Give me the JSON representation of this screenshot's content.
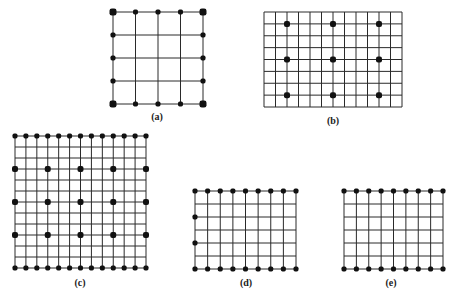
{
  "figure": {
    "background": "#ffffff",
    "line_color": "#2a2a2a",
    "dot_color": "#111111",
    "panels": [
      {
        "id": "a",
        "label": "(a)",
        "x": 113,
        "y": 12,
        "width": 90,
        "height": 92,
        "cols": 4,
        "rows": 4,
        "label_x": 157,
        "label_y": 111,
        "dots": "boundary-all",
        "corner_dot_size": 7,
        "dot_size": 5
      },
      {
        "id": "b",
        "label": "(b)",
        "x": 264,
        "y": 12,
        "width": 138,
        "height": 95,
        "cols": 12,
        "rows": 8,
        "label_x": 333,
        "label_y": 115,
        "dots": "interior-points",
        "points": [
          [
            2,
            1
          ],
          [
            6,
            1
          ],
          [
            10,
            1
          ],
          [
            2,
            4
          ],
          [
            6,
            4
          ],
          [
            10,
            4
          ],
          [
            2,
            7
          ],
          [
            6,
            7
          ],
          [
            10,
            7
          ]
        ],
        "dot_size": 6
      },
      {
        "id": "c",
        "label": "(c)",
        "x": 15,
        "y": 136,
        "width": 131,
        "height": 132,
        "cols": 12,
        "rows": 12,
        "label_x": 80,
        "label_y": 277,
        "dots": "top-bottom-plus-rows",
        "dotted_rows": [
          3,
          6,
          9
        ],
        "dotted_row_cols": [
          0,
          3,
          6,
          9,
          12
        ],
        "dot_size": 5,
        "row_dot_size": 6
      },
      {
        "id": "d",
        "label": "(d)",
        "x": 195,
        "y": 191,
        "width": 101,
        "height": 78,
        "cols": 8,
        "rows": 6,
        "label_x": 246,
        "label_y": 277,
        "dots": "top-bottom-plus-left",
        "left_rows": [
          2,
          4
        ],
        "dot_size": 5
      },
      {
        "id": "e",
        "label": "(e)",
        "x": 344,
        "y": 191,
        "width": 99,
        "height": 78,
        "cols": 8,
        "rows": 6,
        "label_x": 391,
        "label_y": 277,
        "dots": "top-bottom",
        "dot_size": 5
      }
    ]
  }
}
